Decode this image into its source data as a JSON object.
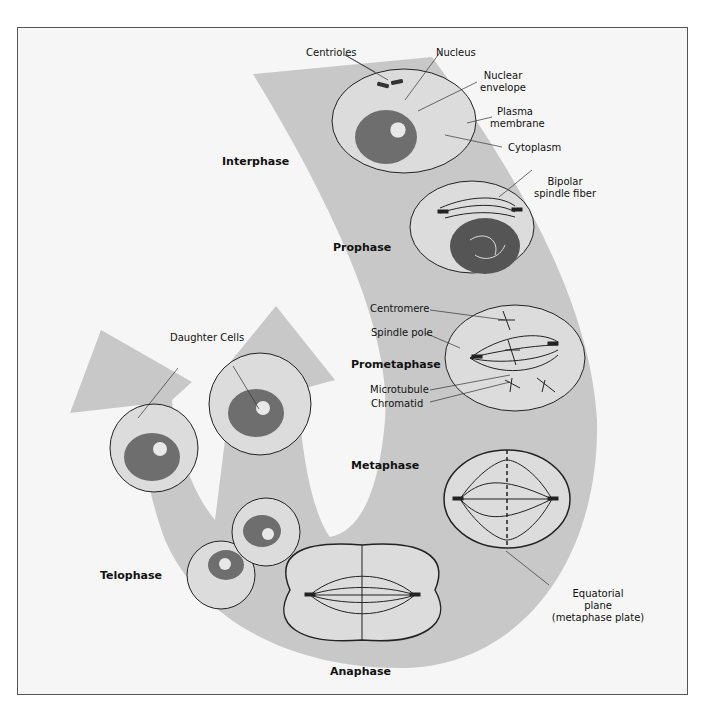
{
  "figure": {
    "colors": {
      "background": "#f6f6f6",
      "band": "#c8c8c8",
      "cytoplasm": "#dcdcdc",
      "nucleus": "#6e6e6e",
      "outline": "#222222"
    }
  },
  "phases": {
    "interphase": "Interphase",
    "prophase": "Prophase",
    "prometaphase": "Prometaphase",
    "metaphase": "Metaphase",
    "anaphase": "Anaphase",
    "telophase": "Telophase"
  },
  "labels": {
    "centrioles": "Centrioles",
    "nucleus": "Nucleus",
    "nuclear_envelope_1": "Nuclear",
    "nuclear_envelope_2": "envelope",
    "plasma_membrane_1": "Plasma",
    "plasma_membrane_2": "membrane",
    "cytoplasm": "Cytoplasm",
    "bipolar_1": "Bipolar",
    "bipolar_2": "spindle fiber",
    "centromere": "Centromere",
    "spindle_pole": "Spindle pole",
    "microtubule": "Microtubule",
    "chromatid": "Chromatid",
    "daughter_cells": "Daughter Cells",
    "equatorial_1": "Equatorial",
    "equatorial_2": "plane",
    "equatorial_3": "(metaphase plate)"
  }
}
